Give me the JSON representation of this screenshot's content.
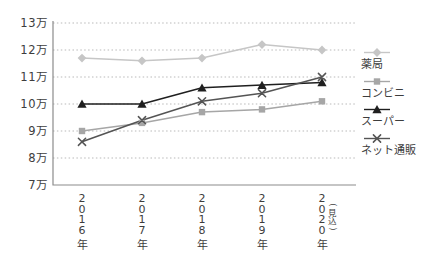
{
  "chart_data": {
    "type": "line",
    "title": "",
    "unit": "万",
    "grid": "dotted-horizontal",
    "legend_position": "right",
    "x_categories": [
      "2016年",
      "2017年",
      "2018年",
      "2019年",
      "2020年(見込)"
    ],
    "x_labels": [
      {
        "year": "2016",
        "suffix": "年",
        "note": ""
      },
      {
        "year": "2017",
        "suffix": "年",
        "note": ""
      },
      {
        "year": "2018",
        "suffix": "年",
        "note": ""
      },
      {
        "year": "2019",
        "suffix": "年",
        "note": ""
      },
      {
        "year": "2020",
        "suffix": "年",
        "note": "(見込)"
      }
    ],
    "y_ticks": [
      {
        "value": 7,
        "label": "7万"
      },
      {
        "value": 8,
        "label": "8万"
      },
      {
        "value": 9,
        "label": "9万"
      },
      {
        "value": 10,
        "label": "10万"
      },
      {
        "value": 11,
        "label": "11万"
      },
      {
        "value": 12,
        "label": "12万"
      },
      {
        "value": 13,
        "label": "13万"
      }
    ],
    "ylim": [
      7,
      13
    ],
    "series": [
      {
        "name": "薬局",
        "marker": "diamond",
        "color": "#c6c6c6",
        "values": [
          11.7,
          11.6,
          11.7,
          12.2,
          12.0
        ]
      },
      {
        "name": "コンビニ",
        "marker": "square",
        "color": "#a6a6a6",
        "values": [
          9.0,
          9.3,
          9.7,
          9.8,
          10.1
        ]
      },
      {
        "name": "スーパー",
        "marker": "triangle",
        "color": "#1f1f1f",
        "values": [
          10.0,
          10.0,
          10.6,
          10.7,
          10.8
        ]
      },
      {
        "name": "ネット通販",
        "marker": "x",
        "color": "#545454",
        "values": [
          8.6,
          9.4,
          10.1,
          10.4,
          11.0
        ]
      }
    ],
    "colors": {
      "grid": "#b9b9b9",
      "axis": "#8c8c8c",
      "tick_text": "#3d3d3d"
    }
  }
}
